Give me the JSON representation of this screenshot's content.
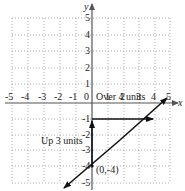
{
  "diagram": {
    "type": "coordinate-plane",
    "axes": {
      "x_label": "x",
      "y_label": "y",
      "x_ticks": [
        "-5",
        "-4",
        "-3",
        "-2",
        "-1",
        "0",
        "1",
        "2",
        "3",
        "4",
        "5"
      ],
      "y_ticks": [
        "5",
        "4",
        "3",
        "2",
        "1",
        "-1",
        "-2",
        "-3",
        "-4",
        "-5"
      ],
      "x_range": [
        -5,
        5
      ],
      "y_range": [
        -5,
        5
      ],
      "grid": "dotted"
    },
    "line": {
      "description": "Line through (0,-4) and (4,-1), slope 3/4",
      "points": [
        [
          0,
          -4
        ],
        [
          4,
          -1
        ]
      ]
    },
    "annotations": {
      "over": "Over 4 units",
      "up": "Up 3 units",
      "point": "(0,-4)"
    },
    "colors": {
      "axis": "#555555",
      "grid": "#9a9a9a",
      "line": "#111111"
    }
  }
}
